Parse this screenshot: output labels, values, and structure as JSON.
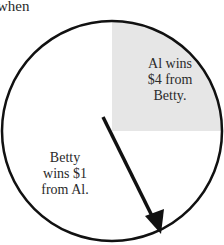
{
  "caption": "when",
  "spinner": {
    "center": [
      112,
      131
    ],
    "radius": 110,
    "shaded_quadrant_color": "#e6e6e6",
    "outline_color": "#111111",
    "arrow_color": "#111111",
    "arrow_start": [
      103,
      117
    ],
    "arrow_end": [
      160,
      233
    ]
  },
  "regions": [
    {
      "name": "al-wins-region",
      "fraction": "1/4",
      "shaded": true,
      "label": "Al wins $4 from Betty.",
      "lines": [
        "Al wins",
        "$4 from",
        "Betty."
      ]
    },
    {
      "name": "betty-wins-region",
      "fraction": "3/4",
      "shaded": false,
      "label": "Betty wins $1 from Al.",
      "lines": [
        "Betty",
        "wins $1",
        "from Al."
      ]
    }
  ]
}
